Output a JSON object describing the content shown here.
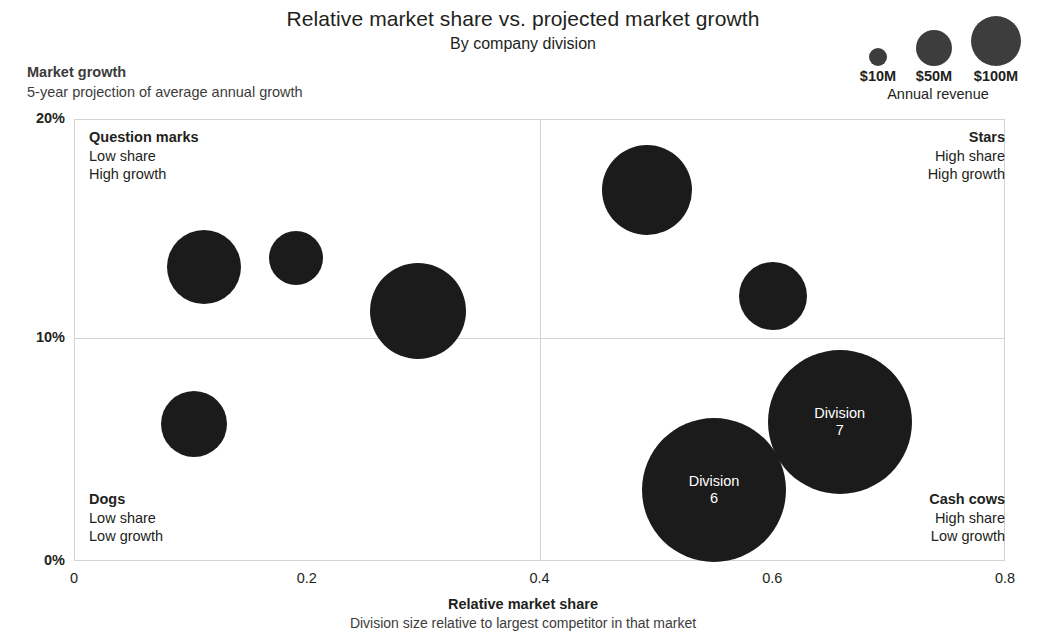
{
  "title": "Relative market share vs. projected market growth",
  "subtitle": "By company division",
  "axes": {
    "y_title": "Market growth",
    "y_subtitle": "5-year projection of average annual growth",
    "x_title": "Relative market share",
    "x_subtitle": "Division size relative to largest competitor in that market"
  },
  "quadrants": [
    {
      "key": "question-marks",
      "name": "Question marks",
      "line1": "Low share",
      "line2": "High growth"
    },
    {
      "key": "stars",
      "name": "Stars",
      "line1": "High share",
      "line2": "High growth"
    },
    {
      "key": "dogs",
      "name": "Dogs",
      "line1": "Low share",
      "line2": "Low growth"
    },
    {
      "key": "cash-cows",
      "name": "Cash cows",
      "line1": "High share",
      "line2": "Low growth"
    }
  ],
  "legend": {
    "caption": "Annual revenue",
    "items": [
      {
        "label": "$10M",
        "radius_px": 9
      },
      {
        "label": "$50M",
        "radius_px": 18
      },
      {
        "label": "$100M",
        "radius_px": 25
      }
    ]
  },
  "chart_data": {
    "type": "scatter",
    "title": "Relative market share vs. projected market growth",
    "subtitle": "By company division",
    "xlabel": "Relative market share",
    "ylabel": "Market growth",
    "xlim": [
      0,
      0.8
    ],
    "ylim": [
      0,
      0.2
    ],
    "xticks": [
      "0",
      "0.2",
      "0.4",
      "0.6",
      "0.8"
    ],
    "xtick_values": [
      0,
      0.2,
      0.4,
      0.6,
      0.8
    ],
    "yticks": [
      "0%",
      "10%",
      "20%"
    ],
    "ytick_values": [
      0,
      0.1,
      0.2
    ],
    "grid": true,
    "legend_position": "top-right",
    "size_encoding": "Annual revenue",
    "quadrant_dividers": {
      "x": 0.4,
      "y": 0.1
    },
    "points": [
      {
        "label": "",
        "x": 0.112,
        "y": 0.133,
        "radius_px": 37,
        "quadrant": "Question marks"
      },
      {
        "label": "",
        "x": 0.191,
        "y": 0.137,
        "radius_px": 27,
        "quadrant": "Question marks"
      },
      {
        "label": "",
        "x": 0.296,
        "y": 0.113,
        "radius_px": 48,
        "quadrant": "Question marks"
      },
      {
        "label": "",
        "x": 0.103,
        "y": 0.062,
        "radius_px": 33,
        "quadrant": "Dogs"
      },
      {
        "label": "",
        "x": 0.492,
        "y": 0.168,
        "radius_px": 45,
        "quadrant": "Stars"
      },
      {
        "label": "",
        "x": 0.601,
        "y": 0.12,
        "radius_px": 34,
        "quadrant": "Stars"
      },
      {
        "label": "Division\n6",
        "label_line1": "Division",
        "label_line2": "6",
        "x": 0.55,
        "y": 0.032,
        "radius_px": 72,
        "quadrant": "Cash cows"
      },
      {
        "label": "Division\n7",
        "label_line1": "Division",
        "label_line2": "7",
        "x": 0.658,
        "y": 0.063,
        "radius_px": 72,
        "quadrant": "Cash cows"
      }
    ]
  },
  "colors": {
    "bubble": "#1b1b1b",
    "legend_bubble": "#3d3d3d",
    "grid": "#d2d2d2",
    "text": "#231f20",
    "muted_text": "#3c3c3c",
    "bubble_label": "#ffffff"
  }
}
